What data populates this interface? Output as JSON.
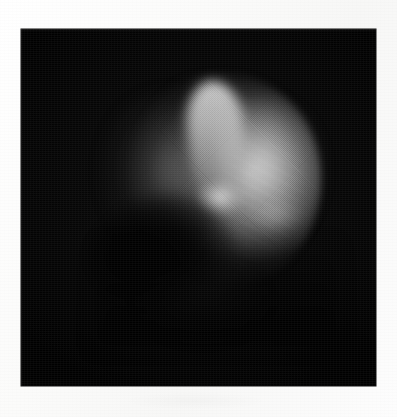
{
  "page": {
    "width": 397,
    "height": 417,
    "background_color": "#fdfdfd"
  },
  "panel": {
    "name": "scintigram-image-panel",
    "x": 21,
    "y": 29,
    "width": 355,
    "height": 357,
    "background_color": "#000000",
    "border_color": "#111111"
  },
  "image": {
    "modality": "scintigraphy",
    "colormap": "grayscale",
    "background_level": "black",
    "object_description": "Single rounded organ-shaped region of tracer uptake occupying the upper-centre of the frame, brightest along a vertical band just right of the midline and across the right-hand mass, with a dark photopenic notch indenting the lower-left border.",
    "features": [
      {
        "name": "uptake-base",
        "label": "Broad organ outline",
        "center_x": 194,
        "center_y": 151,
        "width": 212,
        "height": 214,
        "intensity": "medium-bright"
      },
      {
        "name": "uptake-left-lobe",
        "label": "Dim left lobe",
        "center_x": 139,
        "center_y": 146,
        "width": 122,
        "height": 168,
        "intensity": "dim"
      },
      {
        "name": "uptake-band",
        "label": "Bright vertical band",
        "center_x": 196,
        "center_y": 121,
        "width": 56,
        "height": 138,
        "intensity": "brightest"
      },
      {
        "name": "uptake-right-mass",
        "label": "Right-side bright mass",
        "center_x": 250,
        "center_y": 150,
        "width": 108,
        "height": 160,
        "intensity": "bright"
      },
      {
        "name": "uptake-hotspot",
        "label": "Focal hotspot",
        "center_x": 199,
        "center_y": 169,
        "width": 46,
        "height": 34,
        "intensity": "focal-bright"
      },
      {
        "name": "uptake-hotspot-secondary",
        "label": "Secondary soft hotspot",
        "center_x": 254,
        "center_y": 185,
        "width": 56,
        "height": 34,
        "intensity": "soft-bright"
      },
      {
        "name": "photopenic-notch",
        "label": "Photopenic notch (lower-left)",
        "center_x": 139,
        "center_y": 226,
        "width": 150,
        "height": 116,
        "intensity": "dark"
      }
    ],
    "grain": {
      "label": "Halftone scan grain",
      "present": true,
      "strength": "moderate"
    }
  },
  "annotations": {
    "text_present": false,
    "labels": [],
    "scale_bar": null,
    "caption": null
  }
}
